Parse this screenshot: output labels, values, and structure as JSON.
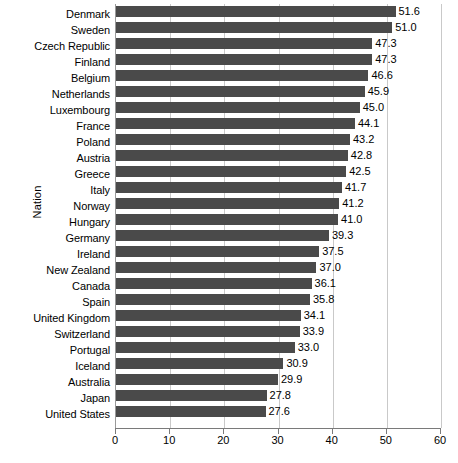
{
  "chart_data": {
    "type": "bar",
    "orientation": "horizontal",
    "title": "",
    "xlabel": "",
    "ylabel": "Nation",
    "xlim": [
      0,
      60
    ],
    "xticks": [
      0,
      10,
      20,
      30,
      40,
      50,
      60
    ],
    "grid": true,
    "legend": null,
    "bar_color": "#4a4a4a",
    "value_label_format": "one-decimal",
    "categories": [
      "Denmark",
      "Sweden",
      "Czech Republic",
      "Finland",
      "Belgium",
      "Netherlands",
      "Luxembourg",
      "France",
      "Poland",
      "Austria",
      "Greece",
      "Italy",
      "Norway",
      "Hungary",
      "Germany",
      "Ireland",
      "New Zealand",
      "Canada",
      "Spain",
      "United Kingdom",
      "Switzerland",
      "Portugal",
      "Iceland",
      "Australia",
      "Japan",
      "United States"
    ],
    "values": [
      51.6,
      51.0,
      47.3,
      47.3,
      46.6,
      45.9,
      45.0,
      44.1,
      43.2,
      42.8,
      42.5,
      41.7,
      41.2,
      41.0,
      39.3,
      37.5,
      37.0,
      36.1,
      35.8,
      34.1,
      33.9,
      33.0,
      30.9,
      29.9,
      27.8,
      27.6
    ],
    "value_labels": [
      "51.6",
      "51.0",
      "47.3",
      "47.3",
      "46.6",
      "45.9",
      "45.0",
      "44.1",
      "43.2",
      "42.8",
      "42.5",
      "41.7",
      "41.2",
      "41.0",
      "39.3",
      "37.5",
      "37.0",
      "36.1",
      "35.8",
      "34.1",
      "33.9",
      "33.0",
      "30.9",
      "29.9",
      "27.8",
      "27.6"
    ],
    "xtick_labels": [
      "0",
      "10",
      "20",
      "30",
      "40",
      "50",
      "60"
    ]
  }
}
